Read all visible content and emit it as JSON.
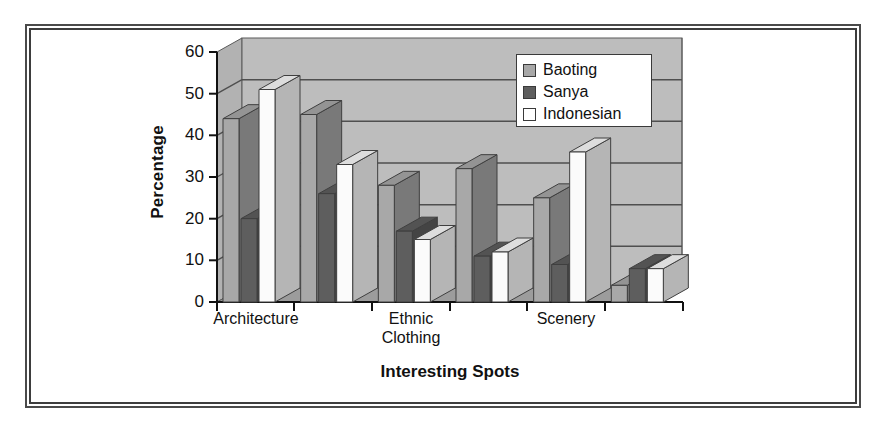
{
  "chart_data": {
    "type": "bar",
    "title": "",
    "xlabel": "Interesting Spots",
    "ylabel": "Percentage",
    "ylim": [
      0,
      60
    ],
    "yticks": [
      0,
      10,
      20,
      30,
      40,
      50,
      60
    ],
    "grid": true,
    "legend_position": "top-right",
    "categories": [
      "Architecture",
      "",
      "Ethnic Clothing",
      "",
      "Scenery",
      ""
    ],
    "visible_tick_labels": [
      "Architecture",
      "Ethnic Clothing",
      "Scenery"
    ],
    "series": [
      {
        "name": "Baoting",
        "color": "#a8a8a8",
        "values": [
          44,
          45,
          28,
          32,
          25,
          4
        ]
      },
      {
        "name": "Sanya",
        "color": "#5e5e5e",
        "values": [
          20,
          26,
          17,
          11,
          9,
          8
        ]
      },
      {
        "name": "Indonesian",
        "color": "#fbfbfb",
        "values": [
          51,
          33,
          15,
          12,
          36,
          8
        ]
      }
    ]
  },
  "legend": {
    "entries": [
      {
        "label": "Baoting"
      },
      {
        "label": "Sanya"
      },
      {
        "label": "Indonesian"
      }
    ]
  },
  "axes": {
    "y_title": "Percentage",
    "x_title": "Interesting Spots",
    "y_tick_labels": [
      "60",
      "50",
      "40",
      "30",
      "20",
      "10",
      "0"
    ],
    "x_tick_labels": [
      "Architecture",
      "Ethnic",
      "Clothing",
      "Scenery"
    ]
  },
  "colors": {
    "plot_background": "#bdbdbd",
    "wall_shade": "#b2b2b2",
    "floor_shade": "#9c9c9c",
    "frame": "#4a4a4a",
    "page_background": "#ffffff"
  }
}
